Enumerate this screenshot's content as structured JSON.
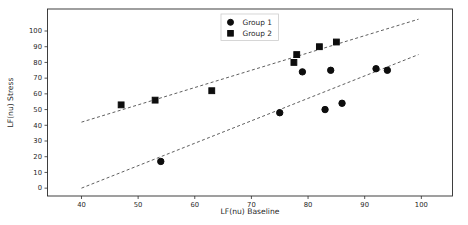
{
  "chart_data": {
    "type": "scatter",
    "title": "",
    "xlabel": "LF(nu) Baseline",
    "ylabel": "LF(nu) Stress",
    "xlim": [
      34,
      105.5
    ],
    "ylim": [
      -5,
      114
    ],
    "x_ticks": [
      40,
      50,
      60,
      70,
      80,
      90,
      100
    ],
    "y_ticks": [
      0,
      10,
      20,
      30,
      40,
      50,
      60,
      70,
      80,
      90,
      100
    ],
    "grid": false,
    "legend_position": "upper center",
    "marker_color": "#0d0d0d",
    "trendline_color": "#4d4d4d",
    "series": [
      {
        "name": "Group 1",
        "marker": "circle",
        "points": [
          [
            54,
            17
          ],
          [
            75,
            48
          ],
          [
            79,
            74
          ],
          [
            83,
            50
          ],
          [
            84,
            75
          ],
          [
            86,
            54
          ],
          [
            92,
            76
          ],
          [
            94,
            75
          ]
        ],
        "trendline": {
          "x1": 40,
          "y1": 0,
          "x2": 99.5,
          "y2": 85
        }
      },
      {
        "name": "Group 2",
        "marker": "square",
        "points": [
          [
            47,
            53
          ],
          [
            53,
            56
          ],
          [
            63,
            62
          ],
          [
            77.5,
            80
          ],
          [
            78,
            85
          ],
          [
            82,
            90
          ],
          [
            85,
            93
          ]
        ],
        "trendline": {
          "x1": 40,
          "y1": 42,
          "x2": 99.5,
          "y2": 107.5
        }
      }
    ]
  }
}
